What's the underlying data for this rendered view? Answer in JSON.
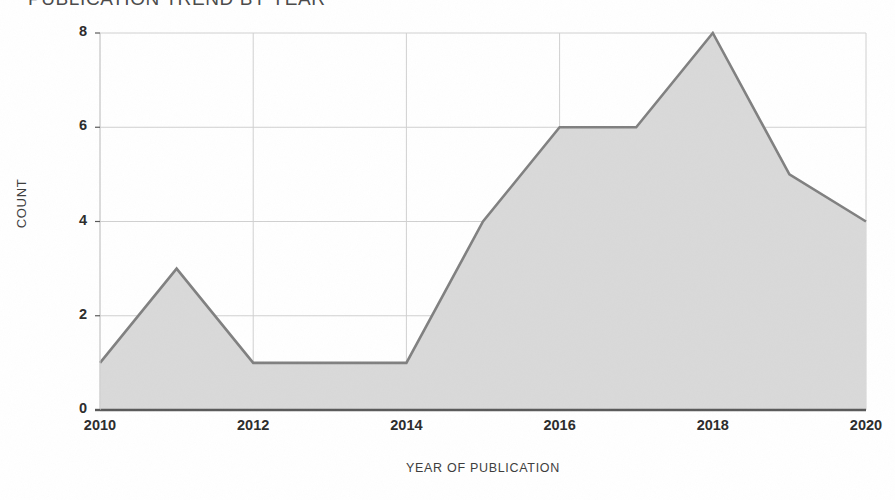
{
  "chart_data": {
    "type": "area",
    "title": "PUBLICATION TREND BY YEAR",
    "xlabel": "YEAR OF PUBLICATION",
    "ylabel": "COUNT",
    "x": [
      2010,
      2011,
      2012,
      2013,
      2014,
      2015,
      2016,
      2017,
      2018,
      2019,
      2020
    ],
    "values": [
      1,
      3,
      1,
      1,
      1,
      4,
      6,
      6,
      8,
      5,
      4
    ],
    "categories": [
      "2010",
      "2011",
      "2012",
      "2013",
      "2014",
      "2015",
      "2016",
      "2017",
      "2018",
      "2019",
      "2020"
    ],
    "series": [
      {
        "name": "Count",
        "values": [
          1,
          3,
          1,
          1,
          1,
          4,
          6,
          6,
          8,
          5,
          4
        ]
      }
    ],
    "xlim": [
      2010,
      2020
    ],
    "ylim": [
      0,
      8
    ],
    "x_ticks": [
      2010,
      2012,
      2014,
      2016,
      2018,
      2020
    ],
    "x_tick_labels": [
      "2010",
      "2012",
      "2014",
      "2016",
      "2018",
      "2020"
    ],
    "y_ticks": [
      0,
      2,
      4,
      6,
      8
    ],
    "y_tick_labels": [
      "0",
      "2",
      "4",
      "6",
      "8"
    ],
    "grid": true,
    "grid_x": true,
    "grid_y": true,
    "legend": false,
    "legend_position": "none",
    "colors": {
      "area_fill": "#d9d9d9",
      "line_stroke": "#808080",
      "grid_line": "#d0d0d0",
      "axis_line": "#595959",
      "tick_text": "#2b2b2b",
      "axis_title_text": "#3c3c3c",
      "title_text": "#4a4a4a",
      "background": "#ffffff"
    }
  }
}
